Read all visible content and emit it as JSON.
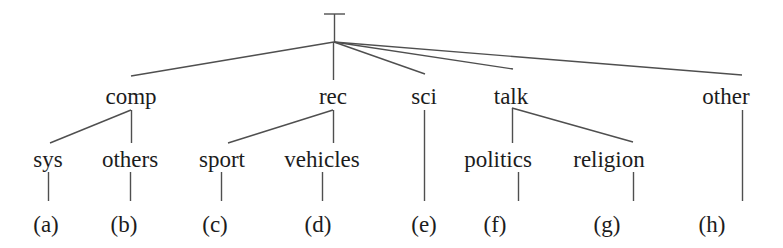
{
  "figure": {
    "type": "hierarchy-tree-diagram",
    "background_color": "#ffffff",
    "line_color": "#4f4f4f",
    "text_color": "#1c1c1c",
    "width": 783,
    "height": 248
  },
  "root": {
    "label": "",
    "marker": "T-bar",
    "x": 334,
    "y": 42
  },
  "level1": [
    {
      "id": "comp",
      "label": "comp",
      "x": 131,
      "y": 96
    },
    {
      "id": "rec",
      "label": "rec",
      "x": 333,
      "y": 96
    },
    {
      "id": "sci",
      "label": "sci",
      "x": 424,
      "y": 96
    },
    {
      "id": "talk",
      "label": "talk",
      "x": 511,
      "y": 96
    },
    {
      "id": "other",
      "label": "other",
      "x": 726,
      "y": 96
    }
  ],
  "level2": [
    {
      "id": "sys",
      "label": "sys",
      "parent": "comp",
      "x": 48,
      "y": 159
    },
    {
      "id": "others",
      "label": "others",
      "parent": "comp",
      "x": 130,
      "y": 159
    },
    {
      "id": "sport",
      "label": "sport",
      "parent": "rec",
      "x": 222,
      "y": 159
    },
    {
      "id": "vehicles",
      "label": "vehicles",
      "parent": "rec",
      "x": 322,
      "y": 159
    },
    {
      "id": "politics",
      "label": "politics",
      "parent": "talk",
      "x": 498,
      "y": 159
    },
    {
      "id": "religion",
      "label": "religion",
      "parent": "talk",
      "x": 609,
      "y": 159
    }
  ],
  "leaves": [
    {
      "id": "a",
      "label": "(a)",
      "parent": "sys",
      "x": 46,
      "y": 224
    },
    {
      "id": "b",
      "label": "(b)",
      "parent": "others",
      "x": 124,
      "y": 224
    },
    {
      "id": "c",
      "label": "(c)",
      "parent": "sport",
      "x": 215,
      "y": 224
    },
    {
      "id": "d",
      "label": "(d)",
      "parent": "vehicles",
      "x": 318,
      "y": 224
    },
    {
      "id": "e",
      "label": "(e)",
      "parent": "sci",
      "x": 424,
      "y": 224
    },
    {
      "id": "f",
      "label": "(f)",
      "parent": "politics",
      "x": 495,
      "y": 224
    },
    {
      "id": "g",
      "label": "(g)",
      "parent": "religion",
      "x": 607,
      "y": 224
    },
    {
      "id": "h",
      "label": "(h)",
      "parent": "other",
      "x": 712,
      "y": 224
    }
  ]
}
